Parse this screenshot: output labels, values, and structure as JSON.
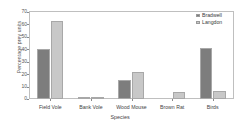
{
  "chart_data": {
    "type": "bar",
    "title": "",
    "xlabel": "Species",
    "ylabel": "Percentage prey units",
    "categories": [
      "Field Vole",
      "Bank Vole",
      "Wood Mouse",
      "Brown Rat",
      "Birds"
    ],
    "series": [
      {
        "name": "Bradwell",
        "color": "#7d7d7d",
        "values": [
          40.5,
          2.0,
          15.0,
          0.0,
          41.0
        ]
      },
      {
        "name": "Langdon",
        "color": "#c8c8c8",
        "values": [
          63.0,
          1.0,
          22.0,
          5.5,
          6.5
        ]
      }
    ],
    "ylim": [
      0,
      70
    ],
    "yticks": [
      0,
      10,
      20,
      30,
      40,
      50,
      60,
      70
    ],
    "ytick_labels": [
      "0",
      "10",
      "20",
      "30",
      "40",
      "50",
      "60",
      "70"
    ],
    "grid": false,
    "legend_position": "top-right",
    "frame": true
  }
}
